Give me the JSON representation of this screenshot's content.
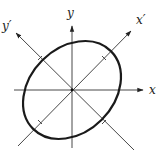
{
  "diagram": {
    "labels": {
      "x": "x",
      "y": "y",
      "x_prime": "x′",
      "y_prime": "y′"
    },
    "rotation_angle_deg": 45,
    "colors": {
      "axis": "#333333",
      "ellipse": "#1a1a1a",
      "background": "#ffffff"
    }
  }
}
